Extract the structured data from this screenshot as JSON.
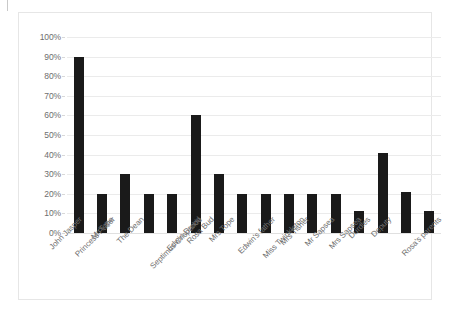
{
  "page": {
    "background_color": "#ffffff",
    "frame_border_color": "#e6e6e6",
    "corner_tick_name": "page-corner-tick"
  },
  "chart_data": {
    "type": "bar",
    "title": "",
    "subtitle": "",
    "xlabel": "",
    "ylabel": "",
    "ylim": [
      0,
      100
    ],
    "y_tick_step": 10,
    "y_tick_labels": [
      "0%",
      "10%",
      "20%",
      "30%",
      "40%",
      "50%",
      "60%",
      "70%",
      "80%",
      "90%",
      "100%"
    ],
    "y_tick_values": [
      0,
      10,
      20,
      30,
      40,
      50,
      60,
      70,
      80,
      90,
      100
    ],
    "grid": true,
    "grid_axis": "y",
    "legend": false,
    "legend_position": "none",
    "bar_color": "#1a1a1a",
    "gridline_color": "#ebebeb",
    "tick_label_color": "#6e6e6e",
    "category_label_color": "#707070",
    "category_label_rotation": -45,
    "categories": [
      "John Jasper",
      "Princess Puffer",
      "Mr Tope",
      "The Dean",
      "Septimus Crisparkle",
      "Edwin Drood",
      "Rosa Bud",
      "Mrs Tope",
      "Edwin's father",
      "Miss Twinkleton",
      "Mrs Tisher",
      "Mr Sapsea",
      "Mrs Sapsea",
      "Durdles",
      "Deputy",
      "Rosa's parents"
    ],
    "values": [
      90,
      20,
      30,
      20,
      20,
      60,
      30,
      20,
      20,
      20,
      20,
      20,
      11,
      41,
      21,
      11
    ],
    "value_labels": [
      "90%",
      "20%",
      "30%",
      "20%",
      "20%",
      "60%",
      "30%",
      "20%",
      "20%",
      "20%",
      "20%",
      "20%",
      "11%",
      "41%",
      "21%",
      "11%"
    ],
    "show_value_labels": false
  }
}
